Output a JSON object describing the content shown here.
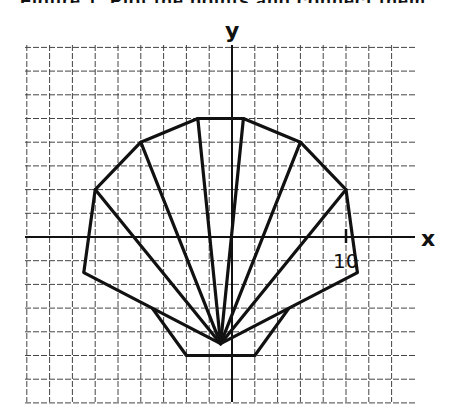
{
  "figure": {
    "type": "coordinate-grid-polygon",
    "axes": {
      "x_label": "x",
      "y_label": "y",
      "tick_label": "10",
      "tick_value": 10,
      "x_range": [
        -18,
        16
      ],
      "y_range": [
        -14,
        16
      ],
      "grid_step": 2
    },
    "shell": {
      "fan_center": [
        -1,
        -9
      ],
      "outline": [
        [
          -13,
          -3
        ],
        [
          -12,
          4
        ],
        [
          -8,
          8
        ],
        [
          -3,
          10
        ],
        [
          1,
          10
        ],
        [
          6,
          8
        ],
        [
          10,
          4
        ],
        [
          11,
          -3
        ]
      ],
      "rays_to": [
        [
          -13,
          -3
        ],
        [
          -12,
          4
        ],
        [
          -8,
          8
        ],
        [
          -3,
          10
        ],
        [
          1,
          10
        ],
        [
          6,
          8
        ],
        [
          10,
          4
        ],
        [
          11,
          -3
        ]
      ],
      "base": [
        [
          -7,
          -6
        ],
        [
          -4,
          -10
        ],
        [
          2,
          -10
        ],
        [
          5,
          -6
        ]
      ]
    },
    "colors": {
      "line": "#111111",
      "grid": "#444444",
      "background": "#ffffff"
    }
  },
  "header_cut_text": "Figure 1, Plot the points and connect them in order."
}
